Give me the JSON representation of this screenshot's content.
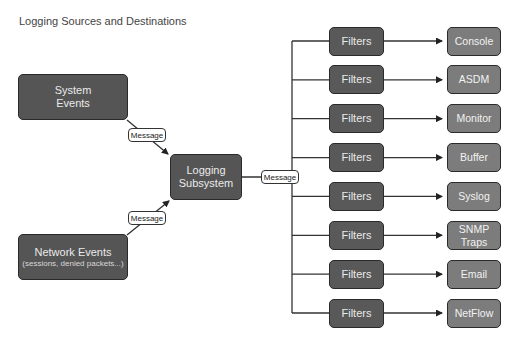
{
  "title": "Logging Sources and Destinations",
  "sources": [
    {
      "label": "System",
      "label2": "Events"
    },
    {
      "label": "Network Events",
      "sub": "(sessions, denied packets...)"
    }
  ],
  "subsystem": {
    "label": "Logging",
    "label2": "Subsystem"
  },
  "message_labels": [
    "Message",
    "Message",
    "Message"
  ],
  "filter_label": "Filters",
  "rows": [
    {
      "filter": "Filters",
      "dest": "Console"
    },
    {
      "filter": "Filters",
      "dest": "ASDM"
    },
    {
      "filter": "Filters",
      "dest": "Monitor"
    },
    {
      "filter": "Filters",
      "dest": "Buffer"
    },
    {
      "filter": "Filters",
      "dest": "Syslog"
    },
    {
      "filter": "Filters",
      "dest": "SNMP",
      "dest2": "Traps"
    },
    {
      "filter": "Filters",
      "dest": "Email"
    },
    {
      "filter": "Filters",
      "dest": "NetFlow"
    }
  ],
  "colors": {
    "dark_box": "#555555",
    "filter_box": "#595959",
    "dest_box": "#7c7c7c",
    "line": "#333333"
  }
}
